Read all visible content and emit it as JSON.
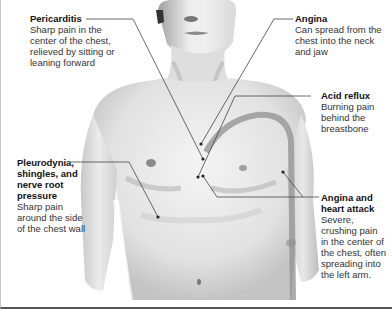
{
  "labels": [
    {
      "id": "pericarditis",
      "title": "Pericarditis",
      "desc": "Sharp pain in the center of the chest, relieved by sitting or leaning forward"
    },
    {
      "id": "angina",
      "title": "Angina",
      "desc": "Can spread from the chest into the neck and jaw"
    },
    {
      "id": "acid-reflux",
      "title": "Acid reflux",
      "desc": "Burning pain behind the breastbone"
    },
    {
      "id": "pleurodynia",
      "title": "Pleurodynia, shingles, and nerve root pressure",
      "desc": "Sharp pain around the side of the chest wall"
    },
    {
      "id": "heart-attack",
      "title": "Angina and heart attack",
      "desc": "Severe, crushing pain in the center of the chest, often spreading into the left arm."
    }
  ],
  "colors": {
    "skin_light": "#f2f2f2",
    "skin_mid": "#d6d6d6",
    "skin_shadow": "#a8a8a8",
    "leader_line": "#444444",
    "reflux_path": "#8a8a8a"
  }
}
